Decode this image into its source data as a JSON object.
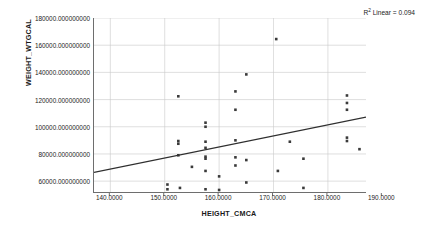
{
  "chart_data": {
    "type": "scatter",
    "title": "",
    "xlabel": "HEIGHT_CMCA",
    "ylabel": "WEIGHT_WTGCAL",
    "xlim": [
      137.0,
      187.0
    ],
    "ylim": [
      52000,
      180000
    ],
    "grid": true,
    "x_ticks": [
      140.0,
      150.0,
      160.0,
      170.0,
      180.0,
      190.0
    ],
    "x_tick_labels": [
      "140.0000",
      "150.0000",
      "160.0000",
      "170.0000",
      "180.0000",
      "190.0000"
    ],
    "y_ticks": [
      60000,
      80000,
      100000,
      120000,
      140000,
      160000,
      180000
    ],
    "y_tick_labels": [
      "60000.000000000",
      "80000.000000000",
      "100000.000000000",
      "120000.000000000",
      "140000.000000000",
      "160000.000000000",
      "180000.000000000"
    ],
    "annotation": "R² Linear = 0.094",
    "annotation_base": "R",
    "annotation_sup": "2",
    "annotation_rest": " Linear = 0.094",
    "r_squared": 0.094,
    "fit_line": {
      "type": "linear",
      "x_start": 137.0,
      "y_start": 66500,
      "x_end": 187.0,
      "y_end": 107000
    },
    "marker": {
      "shape": "square",
      "size_px": 2.6,
      "color": "#3a3a3a"
    },
    "points": [
      {
        "x": 150.5,
        "y": 57500
      },
      {
        "x": 150.5,
        "y": 54000
      },
      {
        "x": 152.5,
        "y": 122400
      },
      {
        "x": 152.5,
        "y": 89500
      },
      {
        "x": 152.5,
        "y": 87500
      },
      {
        "x": 152.5,
        "y": 79000
      },
      {
        "x": 152.8,
        "y": 55000
      },
      {
        "x": 155.0,
        "y": 70500
      },
      {
        "x": 157.5,
        "y": 103000
      },
      {
        "x": 157.5,
        "y": 100000
      },
      {
        "x": 157.5,
        "y": 89000
      },
      {
        "x": 157.5,
        "y": 84500
      },
      {
        "x": 157.5,
        "y": 78000
      },
      {
        "x": 157.5,
        "y": 76500
      },
      {
        "x": 157.5,
        "y": 67500
      },
      {
        "x": 157.5,
        "y": 54000
      },
      {
        "x": 160.0,
        "y": 63500
      },
      {
        "x": 160.0,
        "y": 53500
      },
      {
        "x": 163.0,
        "y": 126000
      },
      {
        "x": 163.0,
        "y": 112500
      },
      {
        "x": 163.0,
        "y": 90000
      },
      {
        "x": 163.0,
        "y": 77500
      },
      {
        "x": 163.0,
        "y": 71500
      },
      {
        "x": 165.0,
        "y": 138500
      },
      {
        "x": 165.0,
        "y": 75500
      },
      {
        "x": 165.0,
        "y": 59000
      },
      {
        "x": 170.5,
        "y": 164500
      },
      {
        "x": 170.8,
        "y": 67500
      },
      {
        "x": 173.0,
        "y": 89000
      },
      {
        "x": 175.5,
        "y": 76500
      },
      {
        "x": 175.5,
        "y": 55000
      },
      {
        "x": 183.5,
        "y": 123000
      },
      {
        "x": 183.5,
        "y": 117500
      },
      {
        "x": 183.5,
        "y": 112500
      },
      {
        "x": 183.5,
        "y": 92000
      },
      {
        "x": 183.5,
        "y": 89500
      },
      {
        "x": 185.8,
        "y": 83500
      }
    ]
  }
}
